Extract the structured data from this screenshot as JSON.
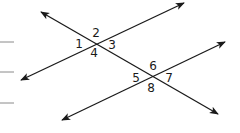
{
  "diagram": {
    "colors": {
      "line": "#1a1a1a",
      "label": "#1a1a1a",
      "margin_dash": "#8a8a8a",
      "background": "#ffffff"
    },
    "lines": [
      {
        "id": "transversal",
        "from": [
          41,
          12
        ],
        "to": [
          218,
          114
        ],
        "arrows": "both"
      },
      {
        "id": "parallel-upper",
        "from": [
          21,
          80
        ],
        "to": [
          184,
          3
        ],
        "arrows": "both"
      },
      {
        "id": "parallel-lower",
        "from": [
          62,
          120
        ],
        "to": [
          225,
          42
        ],
        "arrows": "both"
      }
    ],
    "intersections": [
      {
        "id": "upper",
        "point": [
          96,
          43
        ],
        "angles": [
          "1",
          "2",
          "3",
          "4"
        ]
      },
      {
        "id": "lower",
        "point": [
          152,
          76
        ],
        "angles": [
          "5",
          "6",
          "7",
          "8"
        ]
      }
    ],
    "angle_labels": [
      {
        "text": "1",
        "x": 79,
        "y": 48
      },
      {
        "text": "2",
        "x": 96,
        "y": 37
      },
      {
        "text": "3",
        "x": 112,
        "y": 49
      },
      {
        "text": "4",
        "x": 94,
        "y": 57
      },
      {
        "text": "5",
        "x": 136,
        "y": 82
      },
      {
        "text": "6",
        "x": 153,
        "y": 70
      },
      {
        "text": "7",
        "x": 169,
        "y": 82
      },
      {
        "text": "8",
        "x": 151,
        "y": 92
      }
    ],
    "margin_dashes": [
      {
        "y": 42
      },
      {
        "y": 72
      },
      {
        "y": 103
      }
    ]
  }
}
